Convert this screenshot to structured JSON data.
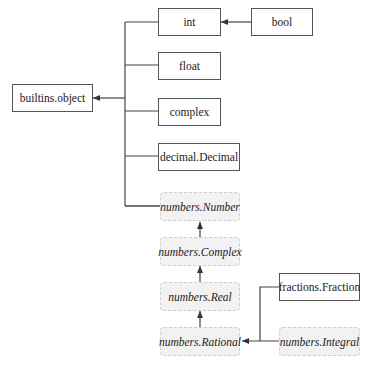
{
  "diagram": {
    "type": "class-hierarchy",
    "nodes": {
      "object": {
        "label": "builtins.object",
        "kind": "concrete"
      },
      "int": {
        "label": "int",
        "kind": "concrete"
      },
      "bool": {
        "label": "bool",
        "kind": "concrete"
      },
      "float": {
        "label": "float",
        "kind": "concrete"
      },
      "complex": {
        "label": "complex",
        "kind": "concrete"
      },
      "decimal": {
        "label": "decimal.Decimal",
        "kind": "concrete"
      },
      "number": {
        "label": "numbers.Number",
        "kind": "abstract"
      },
      "ncomplex": {
        "label": "numbers.Complex",
        "kind": "abstract"
      },
      "real": {
        "label": "numbers.Real",
        "kind": "abstract"
      },
      "rational": {
        "label": "numbers.Rational",
        "kind": "abstract"
      },
      "fraction": {
        "label": "fractions.Fraction",
        "kind": "concrete"
      },
      "integral": {
        "label": "numbers.Integral",
        "kind": "abstract"
      }
    },
    "edges": [
      {
        "from": "bool",
        "to": "int"
      },
      {
        "from": "int",
        "to": "builtins.object"
      },
      {
        "from": "float",
        "to": "builtins.object"
      },
      {
        "from": "complex",
        "to": "builtins.object"
      },
      {
        "from": "decimal.Decimal",
        "to": "builtins.object"
      },
      {
        "from": "numbers.Number",
        "to": "builtins.object"
      },
      {
        "from": "numbers.Complex",
        "to": "numbers.Number"
      },
      {
        "from": "numbers.Real",
        "to": "numbers.Complex"
      },
      {
        "from": "numbers.Rational",
        "to": "numbers.Real"
      },
      {
        "from": "fractions.Fraction",
        "to": "numbers.Rational"
      },
      {
        "from": "numbers.Integral",
        "to": "numbers.Rational"
      }
    ],
    "colors": {
      "line": "#333333",
      "concrete_fill": "#ffffff",
      "concrete_border": "#555555",
      "abstract_fill": "#f2f2f2",
      "abstract_border": "#cfcfcf"
    }
  }
}
